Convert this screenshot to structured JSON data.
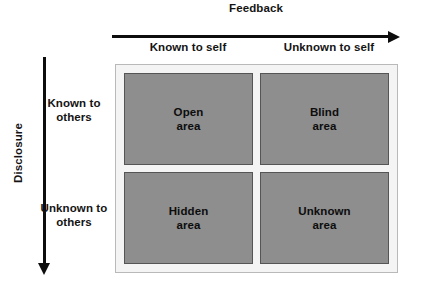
{
  "diagram": {
    "type": "johari-window",
    "horizontal_axis": {
      "title": "Feedback",
      "arrow_direction": "right",
      "column_headers": [
        "Known to self",
        "Unknown to self"
      ]
    },
    "vertical_axis": {
      "title": "Disclosure",
      "arrow_direction": "down",
      "row_headers": [
        {
          "line1": "Known to",
          "line2": "others"
        },
        {
          "line1": "Unknown to",
          "line2": "others"
        }
      ]
    },
    "quadrants": [
      {
        "name": "Open",
        "sub": "area",
        "position": "top-left"
      },
      {
        "name": "Blind",
        "sub": "area",
        "position": "top-right"
      },
      {
        "name": "Hidden",
        "sub": "area",
        "position": "bottom-left"
      },
      {
        "name": "Unknown",
        "sub": "area",
        "position": "bottom-right"
      }
    ],
    "colors": {
      "quadrant_fill": "#8e8e8e",
      "quadrant_border": "#555555",
      "matrix_background": "#f4f4f4",
      "matrix_border": "#b9b9b9",
      "axis": "#0d0d0d",
      "text": "#141414",
      "page_background": "#ffffff"
    }
  }
}
